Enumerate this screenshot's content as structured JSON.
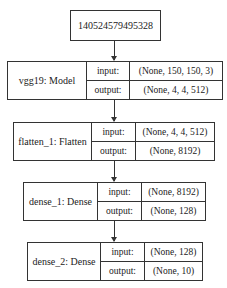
{
  "input_node": {
    "label": "140524579495328"
  },
  "layers": [
    {
      "name": "vgg19: Model",
      "input_label": "input:",
      "output_label": "output:",
      "input_shape": "(None, 150, 150, 3)",
      "output_shape": "(None, 4, 4, 512)"
    },
    {
      "name": "flatten_1: Flatten",
      "input_label": "input:",
      "output_label": "output:",
      "input_shape": "(None, 4, 4, 512)",
      "output_shape": "(None, 8192)"
    },
    {
      "name": "dense_1: Dense",
      "input_label": "input:",
      "output_label": "output:",
      "input_shape": "(None, 8192)",
      "output_shape": "(None, 128)"
    },
    {
      "name": "dense_2: Dense",
      "input_label": "input:",
      "output_label": "output:",
      "input_shape": "(None, 128)",
      "output_shape": "(None, 10)"
    }
  ]
}
